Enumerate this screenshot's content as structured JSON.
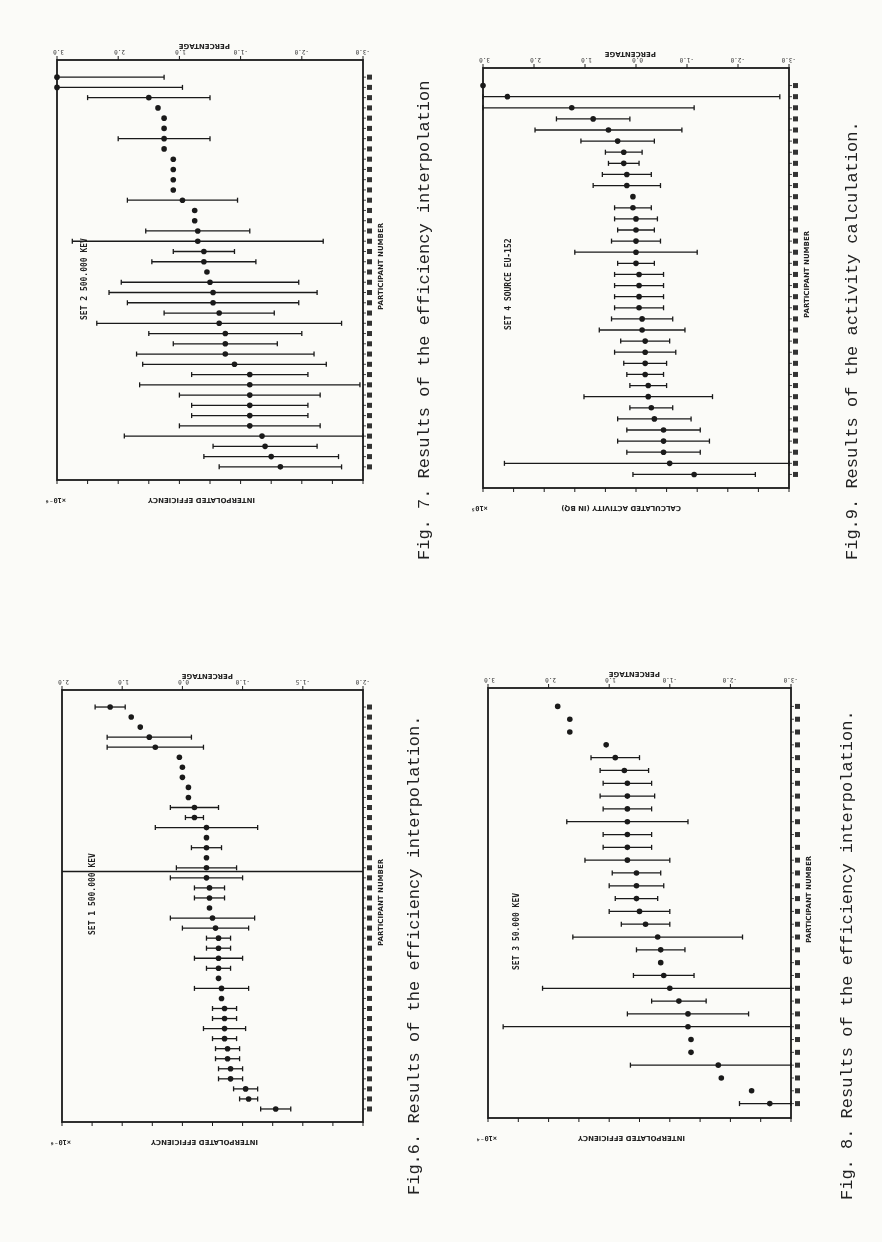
{
  "page": {
    "background": "#fbfbf8",
    "ink": "#1a1a1a"
  },
  "figures": [
    {
      "id": "fig7",
      "caption": "Fig. 7. Results of the efficiency interpolation",
      "set_label": "SET 2   500.000 KEV",
      "top_axis_title": "PERCENTAGE",
      "bottom_axis_title": "INTERPOLATED EFFICIENCY",
      "side_axis_title": "PARTICIPANT NUMBER",
      "multiplier": "×10⁻⁶",
      "percentage_ticks": [
        "-3.0",
        "-2.0",
        "-1.0",
        "1.0",
        "2.0",
        "3.0"
      ],
      "frame": {
        "x": 57,
        "y": 60,
        "w": 306,
        "h": 420
      },
      "caption_pos": {
        "x": 415,
        "y": 560
      },
      "set_pos": {
        "x": 80,
        "y": 320
      }
    },
    {
      "id": "fig9",
      "caption": "Fig.9. Results of the activity calculation.",
      "set_label": "SET 4   SOURCE EU-152",
      "top_axis_title": "PERCENTAGE",
      "bottom_axis_title": "CALCULATED ACTIVITY (IN BQ)",
      "side_axis_title": "PARTICIPANT NUMBER",
      "multiplier": "×10⁵",
      "percentage_ticks": [
        "-3.0",
        "-2.0",
        "-1.0",
        "0.0",
        "1.0",
        "2.0",
        "3.0"
      ],
      "frame": {
        "x": 483,
        "y": 68,
        "w": 306,
        "h": 420
      },
      "caption_pos": {
        "x": 843,
        "y": 560
      },
      "set_pos": {
        "x": 504,
        "y": 330
      }
    },
    {
      "id": "fig6",
      "caption": "Fig.6. Results of the efficiency interpolation.",
      "set_label": "SET 1   500.000 KEV",
      "top_axis_title": "PERCENTAGE",
      "bottom_axis_title": "INTERPOLATED EFFICIENCY",
      "side_axis_title": "PARTICIPANT NUMBER",
      "multiplier": "×10⁻⁶",
      "percentage_ticks": [
        "-2.0",
        "-1.5",
        "-1.0",
        "0.0",
        "1.0",
        "2.0"
      ],
      "frame": {
        "x": 62,
        "y": 690,
        "w": 301,
        "h": 432
      },
      "caption_pos": {
        "x": 405,
        "y": 1195
      },
      "set_pos": {
        "x": 88,
        "y": 935
      }
    },
    {
      "id": "fig8",
      "caption": "Fig. 8. Results of the efficiency interpolation.",
      "set_label": "SET 3   50.000 KEV",
      "top_axis_title": "PERCENTAGE",
      "bottom_axis_title": "INTERPOLATED EFFICIENCY",
      "side_axis_title": "PARTICIPANT NUMBER",
      "multiplier": "×10⁻⁴",
      "percentage_ticks": [
        "-3.0",
        "-2.0",
        "-1.0",
        "1.0",
        "2.0",
        "3.0"
      ],
      "frame": {
        "x": 488,
        "y": 688,
        "w": 303,
        "h": 430
      },
      "caption_pos": {
        "x": 838,
        "y": 1200
      },
      "set_pos": {
        "x": 512,
        "y": 970
      }
    }
  ],
  "chart_data": [
    {
      "type": "scatter",
      "title": "Fig. 7. Results of the efficiency interpolation",
      "subtitle": "SET 2  500.000 KEV",
      "xlabel": "PARTICIPANT NUMBER",
      "ylabel": "INTERPOLATED EFFICIENCY (×10⁻⁶)",
      "secondary_axis": "PERCENTAGE",
      "secondary_ticks": [
        "-3.0",
        "-2.0",
        "-1.0",
        "1.0",
        "2.0",
        "3.0"
      ],
      "orientation": "rotated 90° CCW; value axis horizontal; participants stacked vertically",
      "note": "values given as normalized position 0..1 across the plot frame (left=0); err = half-width of error bar in same units; tick numerals illegible in scan",
      "points": [
        {
          "v": 0.0,
          "err": 0.35
        },
        {
          "v": 0.0,
          "err": 0.41
        },
        {
          "v": 0.3,
          "err": 0.2
        },
        {
          "v": 0.33,
          "err": 0
        },
        {
          "v": 0.35,
          "err": 0
        },
        {
          "v": 0.35,
          "err": 0
        },
        {
          "v": 0.35,
          "err": 0.15
        },
        {
          "v": 0.35,
          "err": 0
        },
        {
          "v": 0.38,
          "err": 0
        },
        {
          "v": 0.38,
          "err": 0
        },
        {
          "v": 0.38,
          "err": 0
        },
        {
          "v": 0.38,
          "err": 0
        },
        {
          "v": 0.41,
          "err": 0.18
        },
        {
          "v": 0.45,
          "err": 0
        },
        {
          "v": 0.45,
          "err": 0
        },
        {
          "v": 0.46,
          "err": 0.17
        },
        {
          "v": 0.46,
          "err": 0.41
        },
        {
          "v": 0.48,
          "err": 0.1
        },
        {
          "v": 0.48,
          "err": 0.17
        },
        {
          "v": 0.49,
          "err": 0
        },
        {
          "v": 0.5,
          "err": 0.29
        },
        {
          "v": 0.51,
          "err": 0.34
        },
        {
          "v": 0.51,
          "err": 0.28
        },
        {
          "v": 0.53,
          "err": 0.18
        },
        {
          "v": 0.53,
          "err": 0.4
        },
        {
          "v": 0.55,
          "err": 0.25
        },
        {
          "v": 0.55,
          "err": 0.17
        },
        {
          "v": 0.55,
          "err": 0.29
        },
        {
          "v": 0.58,
          "err": 0.3
        },
        {
          "v": 0.63,
          "err": 0.19
        },
        {
          "v": 0.63,
          "err": 0.36
        },
        {
          "v": 0.63,
          "err": 0.23
        },
        {
          "v": 0.63,
          "err": 0.19
        },
        {
          "v": 0.63,
          "err": 0.19
        },
        {
          "v": 0.63,
          "err": 0.23
        },
        {
          "v": 0.67,
          "err": 0.45
        },
        {
          "v": 0.68,
          "err": 0.17
        },
        {
          "v": 0.7,
          "err": 0.22
        },
        {
          "v": 0.73,
          "err": 0.2
        }
      ]
    },
    {
      "type": "scatter",
      "title": "Fig.9. Results of the activity calculation.",
      "subtitle": "SET 4  SOURCE EU-152",
      "xlabel": "PARTICIPANT NUMBER",
      "ylabel": "CALCULATED ACTIVITY (IN BQ) (×10⁵)",
      "secondary_axis": "PERCENTAGE",
      "secondary_ticks": [
        "-3.0",
        "-2.0",
        "-1.0",
        "0.0",
        "1.0",
        "2.0",
        "3.0"
      ],
      "orientation": "rotated 90° CCW",
      "note": "normalized 0..1 positions; tick numerals illegible in scan",
      "points": [
        {
          "v": 0.0,
          "err": 0
        },
        {
          "v": 0.08,
          "err": 0.89
        },
        {
          "v": 0.29,
          "err": 0.4
        },
        {
          "v": 0.36,
          "err": 0.12
        },
        {
          "v": 0.41,
          "err": 0.24
        },
        {
          "v": 0.44,
          "err": 0.12
        },
        {
          "v": 0.46,
          "err": 0.06
        },
        {
          "v": 0.46,
          "err": 0.05
        },
        {
          "v": 0.47,
          "err": 0.08
        },
        {
          "v": 0.47,
          "err": 0.11
        },
        {
          "v": 0.49,
          "err": 0
        },
        {
          "v": 0.49,
          "err": 0.06
        },
        {
          "v": 0.5,
          "err": 0.07
        },
        {
          "v": 0.5,
          "err": 0.06
        },
        {
          "v": 0.5,
          "err": 0.08
        },
        {
          "v": 0.5,
          "err": 0.2
        },
        {
          "v": 0.5,
          "err": 0.06
        },
        {
          "v": 0.51,
          "err": 0.08
        },
        {
          "v": 0.51,
          "err": 0.08
        },
        {
          "v": 0.51,
          "err": 0.08
        },
        {
          "v": 0.51,
          "err": 0.08
        },
        {
          "v": 0.52,
          "err": 0.1
        },
        {
          "v": 0.52,
          "err": 0.14
        },
        {
          "v": 0.53,
          "err": 0.08
        },
        {
          "v": 0.53,
          "err": 0.1
        },
        {
          "v": 0.53,
          "err": 0.07
        },
        {
          "v": 0.53,
          "err": 0.06
        },
        {
          "v": 0.54,
          "err": 0.06
        },
        {
          "v": 0.54,
          "err": 0.21
        },
        {
          "v": 0.55,
          "err": 0.07
        },
        {
          "v": 0.56,
          "err": 0.12
        },
        {
          "v": 0.59,
          "err": 0.12
        },
        {
          "v": 0.59,
          "err": 0.15
        },
        {
          "v": 0.59,
          "err": 0.12
        },
        {
          "v": 0.61,
          "err": 0.54
        },
        {
          "v": 0.69,
          "err": 0.2
        }
      ]
    },
    {
      "type": "scatter",
      "title": "Fig.6. Results of the efficiency interpolation.",
      "subtitle": "SET 1  500.000 KEV",
      "xlabel": "PARTICIPANT NUMBER",
      "ylabel": "INTERPOLATED EFFICIENCY (×10⁻⁶)",
      "secondary_axis": "PERCENTAGE",
      "secondary_ticks": [
        "-2.0",
        "-1.5",
        "-1.0",
        "0.0",
        "1.0",
        "2.0"
      ],
      "orientation": "rotated 90° CCW",
      "note": "normalized 0..1 positions; a full-width reference line crosses the plot near the middle; tick numerals illegible in scan",
      "reference_line_at": 0.42,
      "points": [
        {
          "v": 0.16,
          "err": 0.05
        },
        {
          "v": 0.23,
          "err": 0
        },
        {
          "v": 0.26,
          "err": 0
        },
        {
          "v": 0.29,
          "err": 0.14
        },
        {
          "v": 0.31,
          "err": 0.16
        },
        {
          "v": 0.39,
          "err": 0
        },
        {
          "v": 0.4,
          "err": 0
        },
        {
          "v": 0.4,
          "err": 0
        },
        {
          "v": 0.42,
          "err": 0
        },
        {
          "v": 0.42,
          "err": 0
        },
        {
          "v": 0.44,
          "err": 0.08
        },
        {
          "v": 0.44,
          "err": 0.03
        },
        {
          "v": 0.48,
          "err": 0.17
        },
        {
          "v": 0.48,
          "err": 0
        },
        {
          "v": 0.48,
          "err": 0.05
        },
        {
          "v": 0.48,
          "err": 0
        },
        {
          "v": 0.48,
          "err": 0.1
        },
        {
          "v": 0.48,
          "err": 0.12
        },
        {
          "v": 0.49,
          "err": 0.05
        },
        {
          "v": 0.49,
          "err": 0.05
        },
        {
          "v": 0.49,
          "err": 0
        },
        {
          "v": 0.5,
          "err": 0.14
        },
        {
          "v": 0.51,
          "err": 0.11
        },
        {
          "v": 0.52,
          "err": 0.04
        },
        {
          "v": 0.52,
          "err": 0.04
        },
        {
          "v": 0.52,
          "err": 0.08
        },
        {
          "v": 0.52,
          "err": 0.04
        },
        {
          "v": 0.52,
          "err": 0
        },
        {
          "v": 0.53,
          "err": 0.09
        },
        {
          "v": 0.53,
          "err": 0
        },
        {
          "v": 0.54,
          "err": 0.04
        },
        {
          "v": 0.54,
          "err": 0.04
        },
        {
          "v": 0.54,
          "err": 0.07
        },
        {
          "v": 0.54,
          "err": 0.04
        },
        {
          "v": 0.55,
          "err": 0.04
        },
        {
          "v": 0.55,
          "err": 0.04
        },
        {
          "v": 0.56,
          "err": 0.04
        },
        {
          "v": 0.56,
          "err": 0.04
        },
        {
          "v": 0.61,
          "err": 0.04
        },
        {
          "v": 0.62,
          "err": 0.03
        },
        {
          "v": 0.71,
          "err": 0.05
        }
      ]
    },
    {
      "type": "scatter",
      "title": "Fig. 8. Results of the efficiency interpolation.",
      "subtitle": "SET 3  50.000 KEV",
      "xlabel": "PARTICIPANT NUMBER",
      "ylabel": "INTERPOLATED EFFICIENCY (×10⁻⁴)",
      "secondary_axis": "PERCENTAGE",
      "secondary_ticks": [
        "-3.0",
        "-2.0",
        "-1.0",
        "1.0",
        "2.0",
        "3.0"
      ],
      "orientation": "rotated 90° CCW",
      "note": "normalized 0..1 positions; tick numerals illegible in scan",
      "points": [
        {
          "v": 0.23,
          "err": 0
        },
        {
          "v": 0.27,
          "err": 0
        },
        {
          "v": 0.27,
          "err": 0
        },
        {
          "v": 0.39,
          "err": 0
        },
        {
          "v": 0.42,
          "err": 0.08
        },
        {
          "v": 0.45,
          "err": 0.08
        },
        {
          "v": 0.46,
          "err": 0.08
        },
        {
          "v": 0.46,
          "err": 0.09
        },
        {
          "v": 0.46,
          "err": 0.08
        },
        {
          "v": 0.46,
          "err": 0.2
        },
        {
          "v": 0.46,
          "err": 0.08
        },
        {
          "v": 0.46,
          "err": 0.08
        },
        {
          "v": 0.46,
          "err": 0.14
        },
        {
          "v": 0.49,
          "err": 0.08
        },
        {
          "v": 0.49,
          "err": 0.09
        },
        {
          "v": 0.49,
          "err": 0.07
        },
        {
          "v": 0.5,
          "err": 0.1
        },
        {
          "v": 0.52,
          "err": 0.08
        },
        {
          "v": 0.56,
          "err": 0.28
        },
        {
          "v": 0.57,
          "err": 0.08
        },
        {
          "v": 0.57,
          "err": 0
        },
        {
          "v": 0.58,
          "err": 0.1
        },
        {
          "v": 0.6,
          "err": 0.42
        },
        {
          "v": 0.63,
          "err": 0.09
        },
        {
          "v": 0.66,
          "err": 0.2
        },
        {
          "v": 0.66,
          "err": 0.61
        },
        {
          "v": 0.67,
          "err": 0
        },
        {
          "v": 0.67,
          "err": 0
        },
        {
          "v": 0.76,
          "err": 0.29
        },
        {
          "v": 0.77,
          "err": 0
        },
        {
          "v": 0.87,
          "err": 0
        },
        {
          "v": 0.93,
          "err": 0.1
        }
      ]
    }
  ]
}
